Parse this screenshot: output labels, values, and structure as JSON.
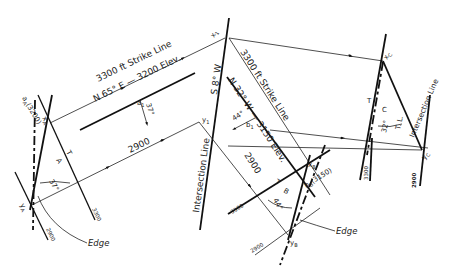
{
  "diagram": {
    "colors": {
      "line": "#111111",
      "background": "#ffffff"
    },
    "labels": {
      "strike_line_top": "3300 ft Strike Line",
      "vein_a_bearing": "N 65° E — 3200 Elev.",
      "vein_a_dip": "37°",
      "point_a1": "a",
      "point_a1_sub": "1",
      "point_aA": "a",
      "point_aA_sub": "A",
      "point_aA_elev": "(3200)",
      "point_xA": "x",
      "point_xA_sub": "A",
      "point_yA": "y",
      "point_yA_sub": "A",
      "view_A_T": "T",
      "view_A_A": "A",
      "view_A_dip": "37°",
      "view_A_3300": "3300",
      "view_A_2900": "2900",
      "edge_left": "Edge",
      "line_2900_left": "2900",
      "intersection_line_left": "Intersection Line",
      "bearing_s8w": "S 8° W",
      "point_x1": "x",
      "point_x1_sub": "1",
      "point_y1": "y",
      "point_y1_sub": "1",
      "strike_line_right": "3300 ft Strike Line",
      "vein_b_bearing": "N 32° W — 3150 Elev.",
      "vein_b_dip": "44°",
      "point_b1": "b",
      "point_b1_sub": "1",
      "line_2900_mid": "2900",
      "view_B_T": "T",
      "view_B_B": "B",
      "view_B_dip": "44°",
      "point_xB": "x",
      "point_xB_sub": "B",
      "point_bB": "b",
      "point_bB_sub": "B",
      "point_bB_elev": "(3150)",
      "point_yB": "y",
      "point_yB_sub": "B",
      "view_B_3300": "3300",
      "view_B_2900": "2900",
      "edge_right": "Edge",
      "point_xC": "x",
      "point_xC_sub": "C",
      "point_yC": "y",
      "point_yC_sub": "C",
      "view_C_T": "T",
      "view_C_C": "C",
      "view_C_plunge": "32°",
      "view_C_TL": "T. L.",
      "intersection_line_right": "Intersection Line",
      "view_C_3300": "3300",
      "view_C_2900": "2900"
    }
  }
}
